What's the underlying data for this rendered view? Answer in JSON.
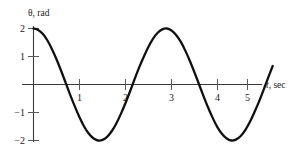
{
  "chart_data": {
    "type": "line",
    "title": "",
    "xlabel": "t, sec",
    "ylabel": "θ, rad",
    "xlim": [
      0,
      5.25
    ],
    "ylim": [
      -2.2,
      2.2
    ],
    "xticks": [
      1,
      2,
      3,
      4,
      5
    ],
    "xtick_labels": [
      "1",
      "2",
      "3",
      "4",
      "5"
    ],
    "yticks": [
      2,
      1,
      -1,
      -2
    ],
    "ytick_labels": [
      "2",
      "1",
      "−1",
      "−2"
    ],
    "grid": false,
    "legend": "none",
    "series": [
      {
        "name": "theta",
        "description": "Damped-free harmonic oscillation, amplitude 2 rad, period about 2.75 s, starting at maximum",
        "amplitude": 2,
        "period": 2.75,
        "phase": 0,
        "x": [
          0.0,
          0.1,
          0.2,
          0.3,
          0.4,
          0.5,
          0.6,
          0.7,
          0.8,
          0.9,
          1.0,
          1.1,
          1.2,
          1.3,
          1.4,
          1.5,
          1.6,
          1.7,
          1.8,
          1.9,
          2.0,
          2.1,
          2.2,
          2.3,
          2.4,
          2.5,
          2.6,
          2.7,
          2.8,
          2.9,
          3.0,
          3.1,
          3.2,
          3.3,
          3.4,
          3.5,
          3.6,
          3.7,
          3.8,
          3.9,
          4.0,
          4.1,
          4.2,
          4.3,
          4.4,
          4.5,
          4.6,
          4.7,
          4.8,
          4.9,
          5.0,
          5.1,
          5.2
        ],
        "y": [
          2.0,
          1.95,
          1.81,
          1.58,
          1.27,
          0.9,
          0.49,
          0.06,
          -0.38,
          -0.79,
          -1.17,
          -1.5,
          -1.75,
          -1.92,
          -2.0,
          -1.98,
          -1.87,
          -1.67,
          -1.39,
          -1.05,
          -0.66,
          -0.24,
          0.2,
          0.62,
          1.0,
          1.35,
          1.64,
          1.85,
          1.97,
          2.0,
          1.93,
          1.77,
          1.53,
          1.21,
          0.84,
          0.43,
          0.0,
          -0.43,
          -0.84,
          -1.21,
          -1.53,
          -1.77,
          -1.93,
          -2.0,
          -1.97,
          -1.85,
          -1.64,
          -1.35,
          -1.0,
          -0.62,
          -0.2,
          0.24,
          0.66
        ],
        "maxima": [
          {
            "t": 0.0,
            "theta": 2
          },
          {
            "t": 2.75,
            "theta": 2
          }
        ],
        "minima": [
          {
            "t": 1.4,
            "theta": -2
          },
          {
            "t": 4.15,
            "theta": -2
          }
        ],
        "zero_crossings": [
          0.69,
          2.07,
          3.44,
          4.82
        ]
      }
    ]
  },
  "annotations": {
    "y_axis_label": "θ, rad",
    "x_axis_label_variable": "t",
    "x_axis_label_unit": ", sec"
  }
}
